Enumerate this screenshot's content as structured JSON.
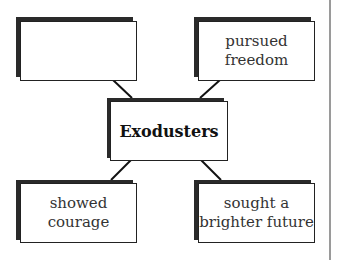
{
  "diagram": {
    "type": "concept-web",
    "center": {
      "label": "Exodusters"
    },
    "nodes": [
      {
        "position": "top-left",
        "label": ""
      },
      {
        "position": "top-right",
        "label": "pursued\nfreedom"
      },
      {
        "position": "bottom-left",
        "label": "showed\ncourage"
      },
      {
        "position": "bottom-right",
        "label": "sought a\nbrighter future"
      }
    ]
  }
}
